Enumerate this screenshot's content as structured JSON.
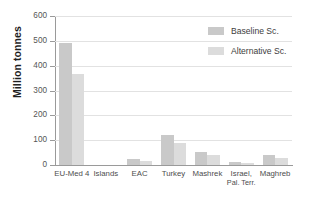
{
  "chart_data": {
    "type": "bar",
    "title": "",
    "xlabel": "",
    "ylabel": "Million tonnes",
    "ylim": [
      0,
      600
    ],
    "ytick_labels": [
      "600",
      "500",
      "400",
      "300",
      "200",
      "100",
      "0"
    ],
    "yticks": [
      600,
      500,
      400,
      300,
      200,
      100,
      0
    ],
    "grid": true,
    "legend_position": "top-right",
    "categories": [
      "EU-Med 4",
      "Islands",
      "EAC",
      "Turkey",
      "Mashrek",
      "Israel,\nPal. Terr.",
      "Maghreb"
    ],
    "category_labels": [
      {
        "line1": "EU-Med 4",
        "line2": ""
      },
      {
        "line1": "Islands",
        "line2": ""
      },
      {
        "line1": "EAC",
        "line2": ""
      },
      {
        "line1": "Turkey",
        "line2": ""
      },
      {
        "line1": "Mashrek",
        "line2": ""
      },
      {
        "line1": "Israel,",
        "line2": "Pal. Terr."
      },
      {
        "line1": "Maghreb",
        "line2": ""
      }
    ],
    "series": [
      {
        "name": "Baseline Sc.",
        "color": "#c9c9c9",
        "values": [
          490,
          0,
          25,
          122,
          52,
          13,
          40
        ]
      },
      {
        "name": "Alternative Sc.",
        "color": "#dcdcdc",
        "values": [
          368,
          0,
          18,
          88,
          40,
          9,
          28
        ]
      }
    ]
  },
  "legend": {
    "items": [
      {
        "label": "Baseline Sc."
      },
      {
        "label": "Alternative Sc."
      }
    ]
  }
}
